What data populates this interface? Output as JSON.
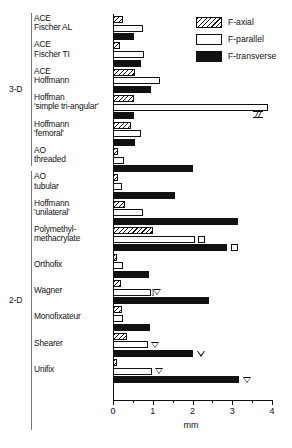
{
  "chart_data": {
    "type": "bar",
    "orientation": "horizontal",
    "title": "",
    "xlabel": "mm",
    "ylabel": "",
    "xlim": [
      0,
      4
    ],
    "xticks": [
      0,
      1,
      2,
      3,
      4
    ],
    "xtick_labels": [
      "0",
      "1",
      "2",
      "3",
      "4"
    ],
    "minor_tick_step": 0.5,
    "grid": false,
    "legend_position": "top-right",
    "series": [
      {
        "name": "F-axial",
        "fill": "hatched",
        "color": "#111111"
      },
      {
        "name": "F-parallel",
        "fill": "white",
        "color": "#ffffff"
      },
      {
        "name": "F-transverse",
        "fill": "solid",
        "color": "#111111"
      }
    ],
    "group_labels": [
      {
        "label": "3-D",
        "from": 0,
        "to": 6
      },
      {
        "label": "2-D",
        "from": 6,
        "to": 16
      }
    ],
    "categories": [
      {
        "line1": "ACE",
        "line2": "Fischer AL"
      },
      {
        "line1": "ACE",
        "line2": "Fischer TI"
      },
      {
        "line1": "ACE",
        "line2": "Hoffmann"
      },
      {
        "line1": "Hoffman",
        "line2": "'simple tri-angular'"
      },
      {
        "line1": "Hoffmann",
        "line2": "'femoral'"
      },
      {
        "line1": "AO",
        "line2": "threaded"
      },
      {
        "line1": "AO",
        "line2": "tubular"
      },
      {
        "line1": "Hoffmann",
        "line2": "'unilateral'"
      },
      {
        "line1": "Polymethyl-",
        "line2": "methacrylate"
      },
      {
        "line1": "Orthofix",
        "line2": ""
      },
      {
        "line1": "Wagner",
        "line2": ""
      },
      {
        "line1": "Monofixateur",
        "line2": ""
      },
      {
        "line1": "Shearer",
        "line2": ""
      },
      {
        "line1": "Unifix",
        "line2": ""
      }
    ],
    "values": {
      "F-axial": [
        0.26,
        0.18,
        0.56,
        0.54,
        0.45,
        0.12,
        0.13,
        0.3,
        1.0,
        0.09,
        0.2,
        0.22,
        0.36,
        0.1
      ],
      "F-parallel": [
        0.76,
        0.78,
        1.18,
        3.9,
        0.7,
        0.28,
        0.22,
        0.76,
        2.06,
        0.24,
        0.96,
        0.26,
        0.88,
        0.98
      ],
      "F-transverse": [
        0.54,
        0.7,
        0.96,
        0.54,
        0.56,
        2.02,
        1.56,
        3.14,
        2.86,
        0.9,
        2.42,
        0.94,
        2.0,
        3.16
      ]
    },
    "markers": [
      {
        "category_index": 8,
        "series": "F-parallel",
        "value": 2.22,
        "glyph": "square"
      },
      {
        "category_index": 8,
        "series": "F-transverse",
        "value": 3.06,
        "glyph": "square"
      },
      {
        "category_index": 10,
        "series": "F-parallel",
        "value": 1.1,
        "glyph": "triangle-down",
        "bracket": true
      },
      {
        "category_index": 12,
        "series": "F-parallel",
        "value": 1.06,
        "glyph": "triangle-down"
      },
      {
        "category_index": 12,
        "series": "F-transverse",
        "value": 2.22,
        "glyph": "triangle-down"
      },
      {
        "category_index": 13,
        "series": "F-parallel",
        "value": 1.16,
        "glyph": "triangle-down"
      },
      {
        "category_index": 13,
        "series": "F-transverse",
        "value": 3.36,
        "glyph": "triangle-down"
      }
    ],
    "axis_breaks": [
      {
        "category_index": 3,
        "series": "F-parallel",
        "at": 3.52
      }
    ]
  }
}
